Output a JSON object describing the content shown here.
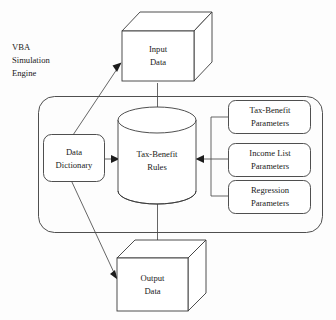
{
  "diagram": {
    "background_color": "#fdfdfd",
    "stroke_color": "#3b3b3b",
    "text_color": "#1a1a1a",
    "corner_label": {
      "lines": [
        "VBA",
        "Simulation",
        "Engine"
      ]
    },
    "container": {
      "name": "simulation-engine-boundary",
      "shape": "rounded-rectangle",
      "label": ""
    },
    "nodes": {
      "input_data": {
        "shape": "3d-box",
        "lines": [
          "Input",
          "Data"
        ]
      },
      "output_data": {
        "shape": "3d-box",
        "lines": [
          "Output",
          "Data"
        ]
      },
      "tax_benefit_rules": {
        "shape": "cylinder",
        "lines": [
          "Tax-Benefit",
          "Rules"
        ]
      },
      "data_dictionary": {
        "shape": "rounded-rectangle",
        "lines": [
          "Data",
          "Dictionary"
        ]
      },
      "tax_benefit_parameters": {
        "shape": "rounded-rectangle",
        "lines": [
          "Tax-Benefit",
          "Parameters"
        ]
      },
      "income_list_parameters": {
        "shape": "rounded-rectangle",
        "lines": [
          "Income List",
          "Parameters"
        ]
      },
      "regression_parameters": {
        "shape": "rounded-rectangle",
        "lines": [
          "Regression",
          "Parameters"
        ]
      }
    },
    "edges": [
      {
        "id": "dd-to-input",
        "from": "data_dictionary",
        "to": "input_data",
        "style": "diagonal-arrow"
      },
      {
        "id": "input-to-rules",
        "from": "input_data",
        "to": "tax_benefit_rules",
        "style": "vertical-arrow"
      },
      {
        "id": "dd-to-rules",
        "from": "data_dictionary",
        "to": "tax_benefit_rules",
        "style": "horizontal-arrow"
      },
      {
        "id": "dd-to-output",
        "from": "data_dictionary",
        "to": "output_data",
        "style": "diagonal-arrow"
      },
      {
        "id": "rules-to-output",
        "from": "tax_benefit_rules",
        "to": "output_data",
        "style": "vertical-arrow"
      },
      {
        "id": "params-bus-to-rules",
        "from": "parameter_boxes",
        "to": "tax_benefit_rules",
        "style": "bus-arrow"
      }
    ]
  }
}
